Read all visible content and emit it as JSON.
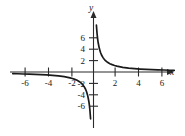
{
  "chart_data": {
    "type": "line",
    "title": "",
    "xlabel": "x",
    "ylabel": "y",
    "xlim": [
      -7.3,
      7.0
    ],
    "ylim": [
      -7.6,
      7.8
    ],
    "grid": false,
    "legend": null,
    "function": "y = 1/x",
    "x_ticks": [
      -6,
      -4,
      -2,
      2,
      4,
      6
    ],
    "x_tick_labels": [
      "-6",
      "-4",
      "-2",
      "2",
      "4",
      "6"
    ],
    "y_ticks": [
      6,
      4,
      2,
      -2,
      -4,
      -6
    ],
    "y_tick_labels": [
      "6",
      "4",
      "2",
      "-2",
      "-4",
      "-6"
    ],
    "series": [
      {
        "name": "branch-right",
        "x": [
          0.14,
          0.16,
          0.18,
          0.2,
          0.25,
          0.3,
          0.35,
          0.4,
          0.5,
          0.6,
          0.7,
          0.8,
          0.9,
          1.0,
          1.2,
          1.4,
          1.6,
          1.8,
          2.0,
          2.5,
          3.0,
          3.5,
          4.0,
          4.5,
          5.0,
          5.5,
          6.0,
          6.5,
          6.9
        ],
        "y": [
          7.14,
          6.25,
          5.56,
          5.0,
          4.0,
          3.33,
          2.86,
          2.5,
          2.0,
          1.67,
          1.43,
          1.25,
          1.11,
          1.0,
          0.83,
          0.71,
          0.63,
          0.56,
          0.5,
          0.4,
          0.33,
          0.29,
          0.25,
          0.22,
          0.2,
          0.18,
          0.17,
          0.15,
          0.14
        ]
      },
      {
        "name": "branch-left",
        "x": [
          -6.9,
          -6.5,
          -6.0,
          -5.5,
          -5.0,
          -4.5,
          -4.0,
          -3.5,
          -3.0,
          -2.5,
          -2.0,
          -1.8,
          -1.6,
          -1.4,
          -1.2,
          -1.0,
          -0.9,
          -0.8,
          -0.7,
          -0.6,
          -0.5,
          -0.4,
          -0.35,
          -0.3,
          -0.25,
          -0.2,
          -0.18,
          -0.16,
          -0.14
        ],
        "y": [
          -0.14,
          -0.15,
          -0.17,
          -0.18,
          -0.2,
          -0.22,
          -0.25,
          -0.29,
          -0.33,
          -0.4,
          -0.5,
          -0.56,
          -0.63,
          -0.71,
          -0.83,
          -1.0,
          -1.11,
          -1.25,
          -1.43,
          -1.67,
          -2.0,
          -2.5,
          -2.86,
          -3.33,
          -4.0,
          -5.0,
          -5.56,
          -6.25,
          -7.14
        ]
      }
    ],
    "annotations": []
  },
  "axes": {
    "x_axis_label": "x",
    "y_axis_label": "y"
  },
  "colors": {
    "curve": "#1a1a1a",
    "axis": "#2b2b2b",
    "background": "#ffffff"
  }
}
